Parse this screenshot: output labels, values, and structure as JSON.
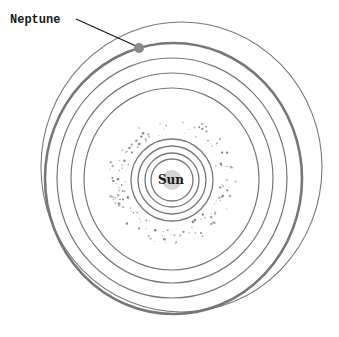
{
  "diagram": {
    "type": "solar-system-orbits",
    "sun": {
      "label": "Sun",
      "cx": 172,
      "cy": 180,
      "r": 10,
      "color": "#d6d6d6"
    },
    "callout": {
      "label": "Neptune",
      "x": 10,
      "y": 23,
      "line": [
        76,
        19,
        136,
        46
      ]
    },
    "neptune_planet": {
      "cx": 139,
      "cy": 48,
      "r": 5,
      "color": "#8a8a8a"
    },
    "orbit_color": "#777777",
    "inner_orbits": [
      {
        "name": "mercury-orbit",
        "cx": 172,
        "cy": 180,
        "rx": 21,
        "ry": 21
      },
      {
        "name": "venus-orbit",
        "cx": 172,
        "cy": 180,
        "rx": 27,
        "ry": 27
      },
      {
        "name": "earth-orbit",
        "cx": 172,
        "cy": 180,
        "rx": 34,
        "ry": 34
      },
      {
        "name": "mars-orbit",
        "cx": 172,
        "cy": 180,
        "rx": 41,
        "ry": 41
      }
    ],
    "outer_orbits": [
      {
        "name": "jupiter-orbit",
        "cx": 171.5,
        "cy": 179,
        "rx": 87.5,
        "ry": 91,
        "width": 1.2
      },
      {
        "name": "saturn-orbit",
        "cx": 172,
        "cy": 178,
        "rx": 101,
        "ry": 105,
        "width": 1.2
      },
      {
        "name": "uranus-orbit",
        "cx": 172,
        "cy": 178,
        "rx": 115,
        "ry": 120,
        "width": 1.2
      },
      {
        "name": "neptune-orbit",
        "cx": 173.5,
        "cy": 178.5,
        "rx": 128.5,
        "ry": 135.5,
        "width": 2.6
      },
      {
        "name": "pluto-orbit",
        "cx": 181.5,
        "cy": 167,
        "rx": 140.5,
        "ry": 145,
        "width": 1.1
      }
    ],
    "asteroid_belt": {
      "cx": 172,
      "cy": 180,
      "r_min": 46,
      "r_max": 64,
      "count": 140
    }
  }
}
